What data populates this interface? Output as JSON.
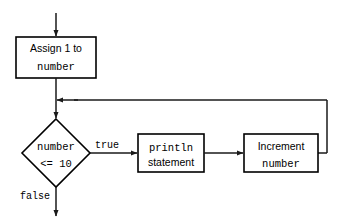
{
  "diagram": {
    "type": "flowchart",
    "background_color": "#ffffff",
    "line_color": "#1a1a1a",
    "text_color": "#000000",
    "nodes": {
      "assign": {
        "shape": "process",
        "line1": "Assign 1 to",
        "line2": "number"
      },
      "condition": {
        "shape": "decision",
        "line1": "number",
        "line2": "<= 10"
      },
      "println": {
        "shape": "process",
        "line1": "println",
        "line2": "statement"
      },
      "increment": {
        "shape": "process",
        "line1": "Increment",
        "line2": "number"
      }
    },
    "edge_labels": {
      "true_label": "true",
      "false_label": "false"
    }
  }
}
